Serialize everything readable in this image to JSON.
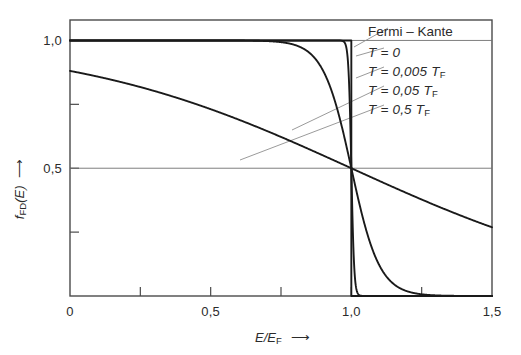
{
  "figure": {
    "background": "#ffffff",
    "ink": "#1a1a1a",
    "thin_ink": "#8a8a8a"
  },
  "axes": {
    "xlabel": "E/E",
    "xlabel_sub": "F",
    "xlabel_arrow": "⟶",
    "ylabel": "f",
    "ylabel_sub": "FD",
    "ylabel_paren": "(E)",
    "ylabel_arrow": "⟶",
    "xticks": [
      {
        "value": 0,
        "label": "0"
      },
      {
        "value": 0.25,
        "label": ""
      },
      {
        "value": 0.5,
        "label": "0,5"
      },
      {
        "value": 0.75,
        "label": ""
      },
      {
        "value": 1.0,
        "label": "1,0"
      },
      {
        "value": 1.25,
        "label": ""
      },
      {
        "value": 1.5,
        "label": "1,5"
      }
    ],
    "yticks": [
      {
        "value": 0.0,
        "label": ""
      },
      {
        "value": 0.25,
        "label": ""
      },
      {
        "value": 0.5,
        "label": "0,5"
      },
      {
        "value": 0.75,
        "label": ""
      },
      {
        "value": 1.0,
        "label": "1,0"
      }
    ],
    "xlim": [
      0,
      1.5
    ],
    "ylim": [
      0,
      1.08
    ],
    "grid": false
  },
  "legend": {
    "title": "Fermi – Kante",
    "entries": [
      {
        "label": "T = 0",
        "T_over_TF": 0
      },
      {
        "label": "T = 0,005 T",
        "T_over_TF": 0.005,
        "sub": "F"
      },
      {
        "label": "T = 0,05 T",
        "T_over_TF": 0.05,
        "sub": "F"
      },
      {
        "label": "T = 0,5 T",
        "T_over_TF": 0.5,
        "sub": "F"
      }
    ]
  },
  "chart_data": {
    "type": "line",
    "title": "",
    "xlabel": "E/E_F",
    "ylabel": "f_FD(E)",
    "xlim": [
      0,
      1.5
    ],
    "ylim": [
      0,
      1.08
    ],
    "grid": false,
    "legend_position": "top-right",
    "annotations": [
      {
        "text": "Fermi - Kante",
        "points_to_x": 1.0,
        "points_to_y": 1.0
      },
      {
        "text": "crossing point: all curves meet",
        "points_to_x": 1.0,
        "points_to_y": 0.5
      }
    ],
    "x": [
      0,
      0.05,
      0.1,
      0.15,
      0.2,
      0.25,
      0.3,
      0.35,
      0.4,
      0.45,
      0.5,
      0.55,
      0.6,
      0.65,
      0.7,
      0.75,
      0.8,
      0.85,
      0.9,
      0.95,
      1.0,
      1.05,
      1.1,
      1.15,
      1.2,
      1.25,
      1.3,
      1.35,
      1.4,
      1.45,
      1.5
    ],
    "series": [
      {
        "name": "T = 0",
        "T_over_TF": 0,
        "values": [
          1.0,
          1.0,
          1.0,
          1.0,
          1.0,
          1.0,
          1.0,
          1.0,
          1.0,
          1.0,
          1.0,
          1.0,
          1.0,
          1.0,
          1.0,
          1.0,
          1.0,
          1.0,
          1.0,
          1.0,
          0.5,
          0.0,
          0.0,
          0.0,
          0.0,
          0.0,
          0.0,
          0.0,
          0.0,
          0.0,
          0.0
        ]
      },
      {
        "name": "T = 0,005 T_F",
        "T_over_TF": 0.005,
        "values": [
          1.0,
          1.0,
          1.0,
          1.0,
          1.0,
          1.0,
          1.0,
          1.0,
          1.0,
          1.0,
          1.0,
          1.0,
          1.0,
          1.0,
          1.0,
          1.0,
          1.0,
          1.0,
          1.0,
          0.99995,
          0.5,
          5e-05,
          0.0,
          0.0,
          0.0,
          0.0,
          0.0,
          0.0,
          0.0,
          0.0,
          0.0
        ]
      },
      {
        "name": "T = 0,05 T_F",
        "T_over_TF": 0.05,
        "values": [
          1.0,
          1.0,
          1.0,
          1.0,
          1.0,
          1.0,
          1.0,
          1.0,
          1.0,
          1.0,
          1.0,
          0.9999,
          0.9997,
          0.9991,
          0.9975,
          0.9933,
          0.982,
          0.953,
          0.881,
          0.731,
          0.5,
          0.269,
          0.119,
          0.047,
          0.018,
          0.0067,
          0.0025,
          0.0009,
          0.0003,
          0.0001,
          5e-05
        ]
      },
      {
        "name": "T = 0,5 T_F",
        "T_over_TF": 0.5,
        "values": [
          0.881,
          0.873,
          0.864,
          0.855,
          0.845,
          0.832,
          0.832,
          0.818,
          0.769,
          0.768,
          0.731,
          0.731,
          0.69,
          0.69,
          0.646,
          0.646,
          0.599,
          0.599,
          0.55,
          0.525,
          0.5,
          0.475,
          0.45,
          0.426,
          0.401,
          0.378,
          0.354,
          0.332,
          0.31,
          0.289,
          0.269
        ]
      }
    ]
  }
}
